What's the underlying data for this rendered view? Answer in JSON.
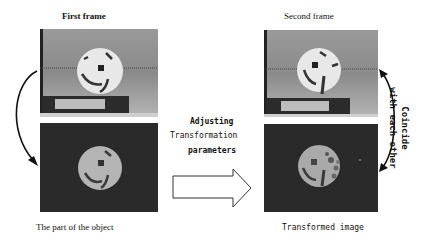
{
  "titles": {
    "first_frame": "First frame",
    "second_frame": "Second frame"
  },
  "captions": {
    "part_of_object": "The part of the object",
    "transformed_image": "Transformed image"
  },
  "middle_text": {
    "line1": "Adjusting",
    "line2": "Transformation",
    "line3": "parameters"
  },
  "side_text": {
    "line1": "Coincide",
    "line2": "with each other"
  },
  "panels": [
    {
      "name": "first-frame-image",
      "content": "ball on box, grey background"
    },
    {
      "name": "object-part-image",
      "content": "segmented ball on black"
    },
    {
      "name": "second-frame-image",
      "content": "ball on box, grey background, rotated"
    },
    {
      "name": "transformed-image",
      "content": "transformed ball on black"
    }
  ],
  "colors": {
    "background": "#ffffff",
    "ink": "#111111",
    "photo_grey": "#8e8e8e",
    "dark_bg": "#2a2a2a"
  }
}
